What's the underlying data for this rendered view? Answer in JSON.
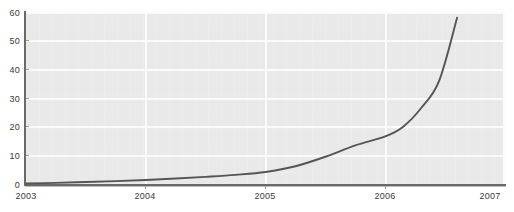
{
  "chart_data": {
    "type": "line",
    "title": "",
    "subtitle": "",
    "xlabel": "",
    "ylabel": "",
    "grid": true,
    "legend": false,
    "legend_position": "none",
    "xlim": [
      2003,
      2007
    ],
    "ylim": [
      0,
      60
    ],
    "xticks": [
      "2003",
      "2004",
      "2005",
      "2006",
      "2007"
    ],
    "yticks": [
      "0",
      "10",
      "20",
      "30",
      "40",
      "50",
      "60"
    ],
    "line_color": "#555555",
    "plot_background": "#e9e9e9",
    "grid_color": "#fafafa",
    "axis_color": "#6a6a6a",
    "series": [
      {
        "name": "value",
        "x": [
          2003.0,
          2003.25,
          2003.5,
          2003.75,
          2004.0,
          2004.25,
          2004.5,
          2004.75,
          2005.0,
          2005.25,
          2005.5,
          2005.75,
          2006.0,
          2006.15,
          2006.3,
          2006.45,
          2006.6
        ],
        "values": [
          0.2,
          0.4,
          0.7,
          1.0,
          1.4,
          1.9,
          2.5,
          3.2,
          4.2,
          6.2,
          9.5,
          13.5,
          16.6,
          20.0,
          26.5,
          36.0,
          58.0
        ]
      }
    ]
  }
}
